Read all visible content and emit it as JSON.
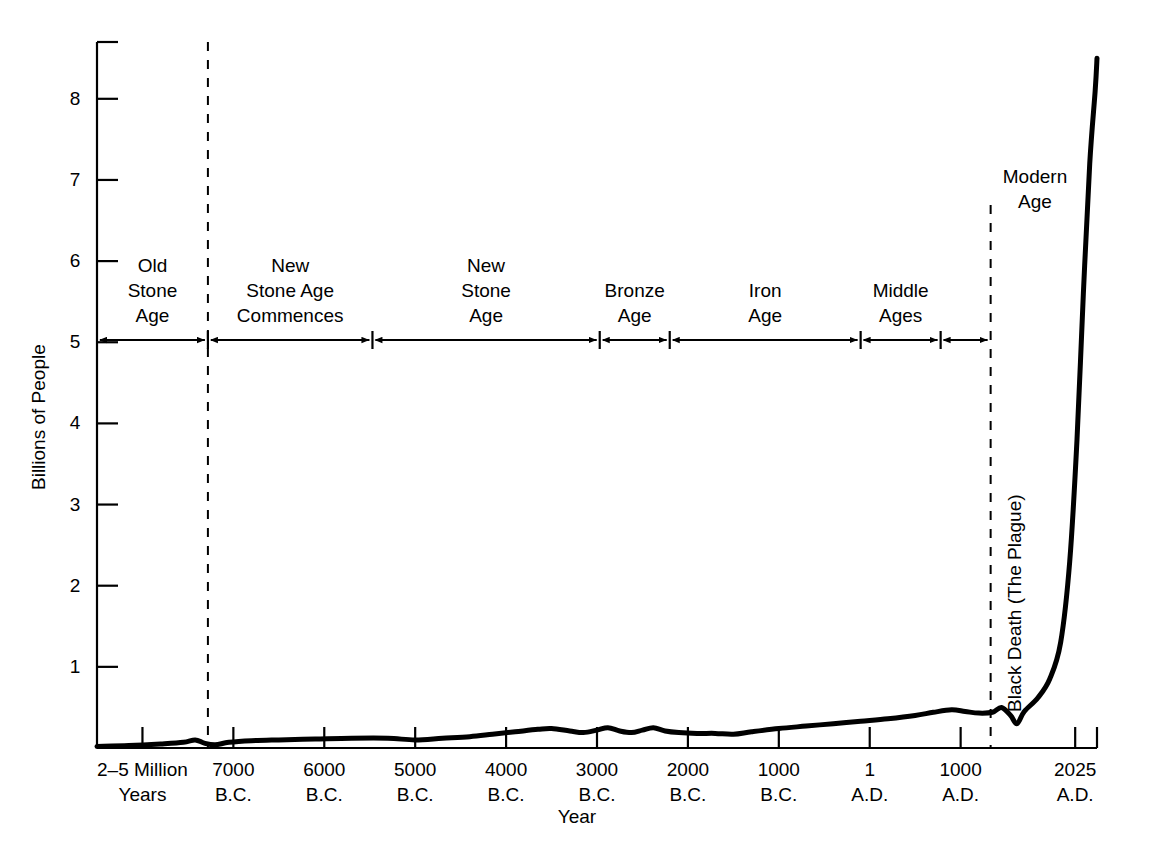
{
  "chart_data": {
    "type": "line",
    "title": "",
    "xlabel": "Year",
    "ylabel": "Billions of People",
    "ylim": [
      0,
      8.7
    ],
    "grid": false,
    "legend": null,
    "y_ticks": [
      {
        "value": 1,
        "label": "1"
      },
      {
        "value": 2,
        "label": "2"
      },
      {
        "value": 3,
        "label": "3"
      },
      {
        "value": 4,
        "label": "4"
      },
      {
        "value": 5,
        "label": "5"
      },
      {
        "value": 6,
        "label": "6"
      },
      {
        "value": 7,
        "label": "7"
      },
      {
        "value": 8,
        "label": "8"
      }
    ],
    "x_ticks": [
      {
        "line1": "2–5 Million",
        "line2": "Years"
      },
      {
        "line1": "7000",
        "line2": "B.C."
      },
      {
        "line1": "6000",
        "line2": "B.C."
      },
      {
        "line1": "5000",
        "line2": "B.C."
      },
      {
        "line1": "4000",
        "line2": "B.C."
      },
      {
        "line1": "3000",
        "line2": "B.C."
      },
      {
        "line1": "2000",
        "line2": "B.C."
      },
      {
        "line1": "1000",
        "line2": "B.C."
      },
      {
        "line1": "1",
        "line2": "A.D."
      },
      {
        "line1": "1000",
        "line2": "A.D."
      },
      {
        "line1": "2025",
        "line2": "A.D."
      }
    ],
    "series": [
      {
        "name": "World population",
        "points": [
          [
            0,
            0.02
          ],
          [
            0.35,
            0.03
          ],
          [
            0.7,
            0.05
          ],
          [
            0.95,
            0.07
          ],
          [
            1.08,
            0.1
          ],
          [
            1.18,
            0.06
          ],
          [
            1.3,
            0.04
          ],
          [
            1.45,
            0.07
          ],
          [
            1.7,
            0.09
          ],
          [
            2.0,
            0.1
          ],
          [
            2.4,
            0.11
          ],
          [
            2.8,
            0.12
          ],
          [
            3.2,
            0.12
          ],
          [
            3.5,
            0.1
          ],
          [
            3.8,
            0.12
          ],
          [
            4.1,
            0.14
          ],
          [
            4.35,
            0.17
          ],
          [
            4.6,
            0.2
          ],
          [
            4.85,
            0.23
          ],
          [
            5.0,
            0.24
          ],
          [
            5.2,
            0.21
          ],
          [
            5.35,
            0.19
          ],
          [
            5.5,
            0.22
          ],
          [
            5.62,
            0.25
          ],
          [
            5.75,
            0.21
          ],
          [
            5.88,
            0.19
          ],
          [
            6.0,
            0.22
          ],
          [
            6.12,
            0.25
          ],
          [
            6.25,
            0.21
          ],
          [
            6.4,
            0.19
          ],
          [
            6.6,
            0.18
          ],
          [
            6.8,
            0.18
          ],
          [
            7.0,
            0.17
          ],
          [
            7.2,
            0.2
          ],
          [
            7.5,
            0.24
          ],
          [
            7.8,
            0.27
          ],
          [
            8.1,
            0.3
          ],
          [
            8.4,
            0.33
          ],
          [
            8.7,
            0.36
          ],
          [
            9.0,
            0.4
          ],
          [
            9.2,
            0.44
          ],
          [
            9.4,
            0.47
          ],
          [
            9.55,
            0.45
          ],
          [
            9.7,
            0.43
          ],
          [
            9.85,
            0.44
          ],
          [
            9.95,
            0.5
          ],
          [
            10.05,
            0.4
          ],
          [
            10.12,
            0.3
          ],
          [
            10.2,
            0.45
          ],
          [
            10.35,
            0.62
          ],
          [
            10.48,
            0.85
          ],
          [
            10.6,
            1.3
          ],
          [
            10.7,
            2.3
          ],
          [
            10.78,
            3.8
          ],
          [
            10.85,
            5.6
          ],
          [
            10.92,
            7.2
          ],
          [
            10.98,
            8.1
          ],
          [
            11.0,
            8.5
          ]
        ],
        "line_width": 5,
        "color": "#000000"
      }
    ],
    "eras": [
      {
        "label": "Old\nStone\nAge",
        "start": 0.0,
        "end": 1.22
      },
      {
        "label": "New\nStone Age\nCommences",
        "start": 1.22,
        "end": 3.03
      },
      {
        "label": "New\nStone\nAge",
        "start": 3.03,
        "end": 5.53
      },
      {
        "label": "Bronze\nAge",
        "start": 5.53,
        "end": 6.3
      },
      {
        "label": "Iron\nAge",
        "start": 6.3,
        "end": 8.4
      },
      {
        "label": "Middle\nAges",
        "start": 8.4,
        "end": 9.28
      },
      {
        "label": "Modern\nAge",
        "start": 9.28,
        "end": 9.83
      }
    ],
    "annotations": [
      {
        "text": "Black Death (The Plague)",
        "orientation": "vertical",
        "x": 10.12,
        "y": 0.3
      },
      {
        "text": "Modern\nAge",
        "orientation": "horizontal",
        "x": 9.55,
        "y": 7.3
      }
    ],
    "dashed_markers": [
      {
        "x": 1.22,
        "note": "Old Stone Age / New Stone Age boundary"
      },
      {
        "x": 9.83,
        "note": "Modern Age start"
      }
    ],
    "accent_color": "#000000",
    "background_color": "#ffffff"
  }
}
